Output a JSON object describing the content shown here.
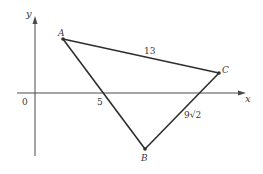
{
  "diagram": {
    "type": "coordinate-geometry",
    "axes": {
      "x_label": "x",
      "y_label": "y",
      "origin_label": "0",
      "x_tick_label": "5"
    },
    "points": [
      {
        "name": "A",
        "label": "A"
      },
      {
        "name": "B",
        "label": "B"
      },
      {
        "name": "C",
        "label": "C"
      }
    ],
    "sides": [
      {
        "from": "A",
        "to": "C",
        "label": "13"
      },
      {
        "from": "B",
        "to": "C",
        "label": "9√2"
      },
      {
        "from": "A",
        "to": "B",
        "label": ""
      }
    ],
    "colors": {
      "line": "#2e2e2e",
      "axis": "#4a4a4a",
      "text": "#3a3a3a"
    }
  }
}
